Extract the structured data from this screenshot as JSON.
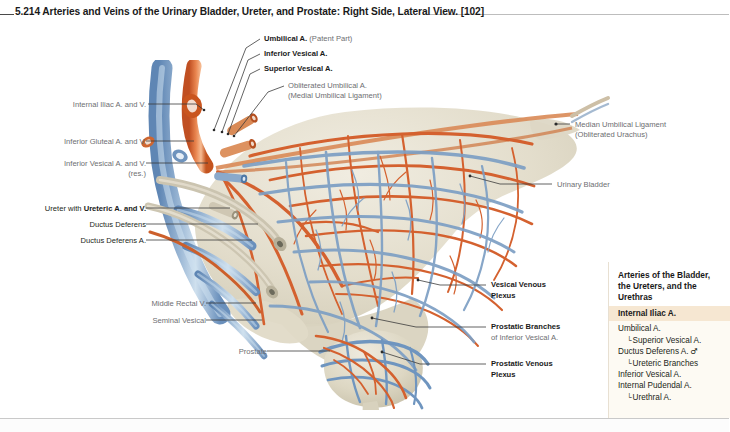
{
  "figure": {
    "number": "5.214",
    "title": "Arteries and Veins of the Urinary Bladder, Ureter, and Prostate: Right Side, Lateral View.",
    "reference": "[102]",
    "full_title": "5.214 Arteries and Veins of the Urinary Bladder, Ureter, and Prostate: Right Side, Lateral View. [102]"
  },
  "callouts": {
    "umbilical_a": {
      "bold": "Umbilical A.",
      "gray": "(Patent Part)"
    },
    "inferior_vesical_a": {
      "bold": "Inferior Vesical A."
    },
    "superior_vesical_a": {
      "bold": "Superior Vesical A."
    },
    "obliterated_umbilical_a": {
      "line1": "Obliterated Umbilical A.",
      "line2": "(Medial Umbilical Ligament)"
    },
    "internal_iliac": {
      "text": "Internal Iliac A. and V."
    },
    "inferior_gluteal": {
      "text": "Inferior Gluteal A. and V."
    },
    "inferior_vesical_av": {
      "line1": "Inferior Vesical A. and V.",
      "line2": "(res.)"
    },
    "ureter": {
      "plain": "Ureter with ",
      "bold": "Ureteric A. and V."
    },
    "ductus_deferens": {
      "text": "Ductus Deferens"
    },
    "ductus_deferens_a": {
      "text": "Ductus Deferens A."
    },
    "middle_rectal_v": {
      "text": "Middle Rectal V."
    },
    "seminal_vesical": {
      "text": "Seminal Vesical"
    },
    "prostate": {
      "text": "Prostate"
    },
    "median_umbilical_ligament": {
      "line1": "Median Umbilical Ligament",
      "line2": "(Obliterated Urachus)"
    },
    "urinary_bladder": {
      "text": "Urinary Bladder"
    },
    "vesical_venous_plexus": {
      "line1": "Vesical Venous",
      "line2": "Plexus"
    },
    "prostatic_branches": {
      "line1": "Prostatic Branches",
      "line2": "of Inferior Vesical A."
    },
    "prostatic_venous_plexus": {
      "line1": "Prostatic Venous",
      "line2": "Plexus"
    }
  },
  "legend": {
    "title": "Arteries of the Bladder, the Ureters, and the Urethras",
    "title_lines": [
      "Arteries of the Bladder,",
      "the Ureters, and the",
      "Urethras"
    ],
    "header": "Internal Iliac A.",
    "items": [
      {
        "label": "Umbilical A.",
        "level": 0,
        "marker": "",
        "male": false
      },
      {
        "label": "Superior Vesical A.",
        "level": 1,
        "marker": "└",
        "male": false
      },
      {
        "label": "Ductus Deferens A.",
        "level": 0,
        "marker": "",
        "male": true
      },
      {
        "label": "Ureteric Branches",
        "level": 1,
        "marker": "└",
        "male": false
      },
      {
        "label": "Inferior Vesical A.",
        "level": 0,
        "marker": "",
        "male": false
      },
      {
        "label": "Internal Pudendal A.",
        "level": 0,
        "marker": "",
        "male": false
      },
      {
        "label": "Urethral A.",
        "level": 1,
        "marker": "└",
        "male": false
      }
    ],
    "male_symbol": "♂"
  },
  "colors": {
    "artery": "#d4612f",
    "artery_light": "#e8915e",
    "vein": "#7d9fc4",
    "vein_dark": "#4f7aa8",
    "tissue": "#ded8c6",
    "tissue_light": "#ebe6d8",
    "legend_header_bg": "#f6e7d2",
    "legend_bg": "#fdfaf3",
    "text": "#231f20",
    "text_gray": "#6d6e71",
    "leader": "#3b3b3b"
  }
}
